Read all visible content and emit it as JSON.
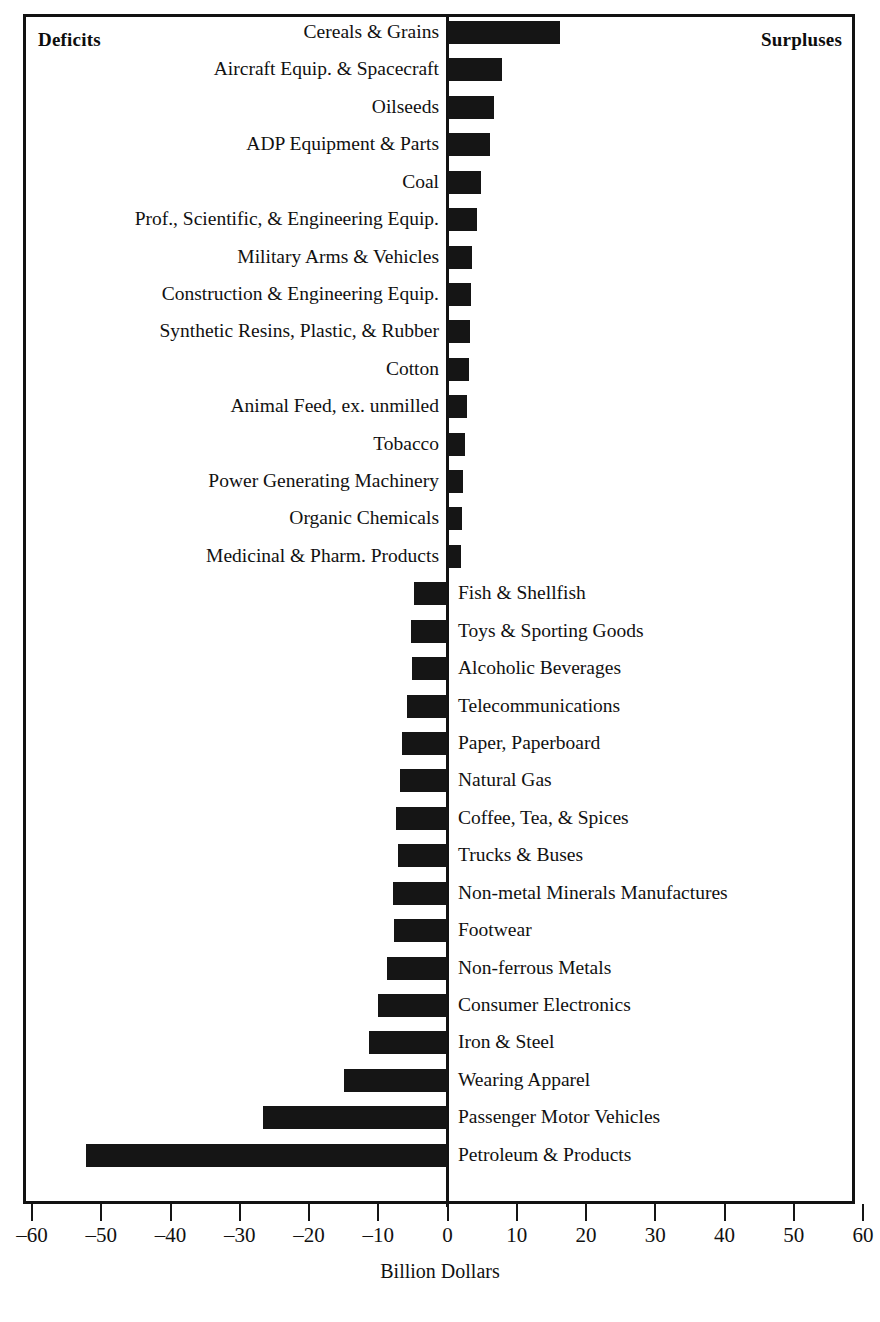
{
  "figure": {
    "deficits_caption": "Deficits",
    "surpluses_caption": "Surpluses",
    "axis_title": "Billion Dollars"
  },
  "chart_data": {
    "type": "bar",
    "orientation": "horizontal",
    "title": "",
    "subtitle": "",
    "xlabel": "Billion Dollars",
    "ylabel": "",
    "xlim": [
      -60,
      60
    ],
    "xticks": [
      -60,
      -50,
      -40,
      -30,
      -20,
      -10,
      0,
      10,
      20,
      30,
      40,
      50,
      60
    ],
    "xtick_labels": [
      "‒60",
      "‒50",
      "‒40",
      "‒30",
      "‒20",
      "‒10",
      "0",
      "10",
      "20",
      "30",
      "40",
      "50",
      "60"
    ],
    "grid": false,
    "legend": null,
    "bar_color": "#151515",
    "annotations": [
      "Deficits",
      "Surpluses"
    ],
    "categories": [
      "Cereals & Grains",
      "Aircraft Equip. & Spacecraft",
      "Oilseeds",
      "ADP Equipment & Parts",
      "Coal",
      "Prof., Scientific, & Engineering Equip.",
      "Military Arms & Vehicles",
      "Construction & Engineering Equip.",
      "Synthetic Resins, Plastic, & Rubber",
      "Cotton",
      "Animal Feed, ex. unmilled",
      "Tobacco",
      "Power Generating Machinery",
      "Organic Chemicals",
      "Medicinal & Pharm. Products",
      "Fish & Shellfish",
      "Toys & Sporting Goods",
      "Alcoholic Beverages",
      "Telecommunications",
      "Paper, Paperboard",
      "Natural Gas",
      "Coffee, Tea, & Spices",
      "Trucks & Buses",
      "Non-metal Minerals Manufactures",
      "Footwear",
      "Non-ferrous Metals",
      "Consumer Electronics",
      "Iron & Steel",
      "Wearing Apparel",
      "Passenger Motor Vehicles",
      "Petroleum & Products"
    ],
    "values": [
      16.3,
      7.8,
      6.7,
      6.2,
      4.8,
      4.2,
      3.6,
      3.4,
      3.2,
      3.1,
      2.8,
      2.5,
      2.3,
      2.1,
      1.9,
      -4.9,
      -5.3,
      -5.1,
      -5.9,
      -6.6,
      -6.8,
      -7.5,
      -7.2,
      -7.9,
      -7.7,
      -8.8,
      -10.1,
      -11.3,
      -15.0,
      -26.7,
      -52.2
    ]
  }
}
